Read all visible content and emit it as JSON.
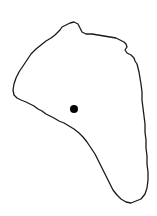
{
  "map": {
    "background": "#ffffff",
    "outline_color": "#1a1a1a",
    "outline_width": 1.3,
    "outline_points": [
      [
        60,
        30
      ],
      [
        62,
        27
      ],
      [
        66,
        25
      ],
      [
        70,
        23
      ],
      [
        74,
        22
      ],
      [
        78,
        24
      ],
      [
        80,
        28
      ],
      [
        82,
        32
      ],
      [
        86,
        34
      ],
      [
        92,
        34
      ],
      [
        98,
        35
      ],
      [
        104,
        36
      ],
      [
        110,
        37
      ],
      [
        116,
        38
      ],
      [
        120,
        40
      ],
      [
        124,
        42
      ],
      [
        126,
        44
      ],
      [
        127,
        47
      ],
      [
        125,
        50
      ],
      [
        127,
        53
      ],
      [
        131,
        55
      ],
      [
        134,
        58
      ],
      [
        135,
        61
      ],
      [
        137,
        64
      ],
      [
        138,
        68
      ],
      [
        139,
        72
      ],
      [
        140,
        78
      ],
      [
        141,
        84
      ],
      [
        142,
        92
      ],
      [
        142,
        100
      ],
      [
        143,
        108
      ],
      [
        144,
        116
      ],
      [
        145,
        124
      ],
      [
        145,
        132
      ],
      [
        146,
        140
      ],
      [
        146,
        148
      ],
      [
        147,
        156
      ],
      [
        147,
        164
      ],
      [
        148,
        172
      ],
      [
        148,
        180
      ],
      [
        147,
        188
      ],
      [
        145,
        194
      ],
      [
        141,
        199
      ],
      [
        136,
        201
      ],
      [
        131,
        203
      ],
      [
        126,
        202
      ],
      [
        121,
        199
      ],
      [
        117,
        195
      ],
      [
        113,
        190
      ],
      [
        110,
        184
      ],
      [
        107,
        178
      ],
      [
        104,
        172
      ],
      [
        101,
        166
      ],
      [
        98,
        160
      ],
      [
        95,
        154
      ],
      [
        91,
        148
      ],
      [
        87,
        142
      ],
      [
        83,
        137
      ],
      [
        79,
        133
      ],
      [
        74,
        129
      ],
      [
        69,
        126
      ],
      [
        64,
        123
      ],
      [
        59,
        121
      ],
      [
        54,
        118
      ],
      [
        50,
        116
      ],
      [
        46,
        114
      ],
      [
        42,
        111
      ],
      [
        38,
        109
      ],
      [
        34,
        106
      ],
      [
        30,
        104
      ],
      [
        26,
        102
      ],
      [
        21,
        100
      ],
      [
        17,
        98
      ],
      [
        14,
        95
      ],
      [
        13,
        90
      ],
      [
        14,
        84
      ],
      [
        16,
        78
      ],
      [
        19,
        72
      ],
      [
        23,
        66
      ],
      [
        27,
        60
      ],
      [
        31,
        54
      ],
      [
        36,
        49
      ],
      [
        41,
        45
      ],
      [
        46,
        41
      ],
      [
        51,
        38
      ],
      [
        55,
        35
      ],
      [
        58,
        32
      ],
      [
        60,
        30
      ]
    ],
    "markers": [
      {
        "label": "location-dot",
        "x": 74,
        "y": 109,
        "r": 4,
        "color": "#000000"
      }
    ]
  }
}
